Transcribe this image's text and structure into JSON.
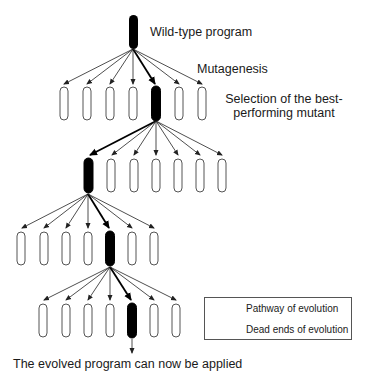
{
  "diagram": {
    "labels": {
      "wild_type": "Wild-type program",
      "mutagenesis": "Mutagenesis",
      "selection_line1": "Selection of the best-",
      "selection_line2": "performing mutant",
      "result": "The evolved program can now be applied"
    },
    "legend": {
      "pathway": "Pathway of evolution",
      "dead_ends": "Dead ends of evolution"
    },
    "colors": {
      "selected_fill": "#000000",
      "candidate_stroke": "#555555",
      "arrow": "#222222"
    },
    "generations": [
      {
        "name": "wild-type",
        "count": 1,
        "selected_index": 0
      },
      {
        "name": "generation-1",
        "count": 7,
        "selected_index": 4
      },
      {
        "name": "generation-2",
        "count": 7,
        "selected_index": 0
      },
      {
        "name": "generation-3",
        "count": 7,
        "selected_index": 4
      },
      {
        "name": "generation-4",
        "count": 7,
        "selected_index": 4
      }
    ]
  }
}
